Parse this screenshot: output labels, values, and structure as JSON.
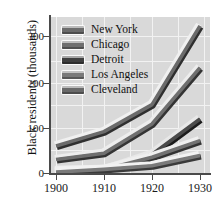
{
  "chart_data": {
    "type": "line",
    "title": "",
    "xlabel": "",
    "ylabel": "Black residents (thousands)",
    "x": [
      1900,
      1910,
      1920,
      1930
    ],
    "xtick_labels": [
      "1900",
      "1910",
      "1920",
      "1930"
    ],
    "ytick_labels": [
      "0",
      "100",
      "200",
      "300"
    ],
    "yticks": [
      0,
      100,
      200,
      300
    ],
    "xlim": [
      1900,
      1930
    ],
    "ylim": [
      0,
      346
    ],
    "grid": true,
    "legend_position": "upper-left-inside",
    "plot_background": "#d9d9d9",
    "gridline_color": "#f2f2f2",
    "series": [
      {
        "name": "New York",
        "values": [
          60,
          92,
          152,
          327
        ],
        "color": "#6b6b6b",
        "shadow_color": "#2f2f2f",
        "highlight_color": "#f0f0f0"
      },
      {
        "name": "Chicago",
        "values": [
          30,
          44,
          109,
          234
        ],
        "color": "#6f6f6f",
        "shadow_color": "#343434",
        "highlight_color": "#ededed"
      },
      {
        "name": "Detroit",
        "values": [
          4,
          6,
          41,
          120
        ],
        "color": "#4b4b4b",
        "shadow_color": "#1c1c1c",
        "highlight_color": "#e8e8e8"
      },
      {
        "name": "Los Angeles",
        "values": [
          2,
          8,
          16,
          39
        ],
        "color": "#7a7a7a",
        "shadow_color": "#3a3a3a",
        "highlight_color": "#f2f2f2"
      },
      {
        "name": "Cleveland",
        "values": [
          6,
          8,
          35,
          72
        ],
        "color": "#727272",
        "shadow_color": "#333333",
        "highlight_color": "#efefef"
      }
    ]
  },
  "legend": {
    "items": [
      {
        "label": "New York",
        "swatch": "#6b6b6b"
      },
      {
        "label": "Chicago",
        "swatch": "#6f6f6f"
      },
      {
        "label": "Detroit",
        "swatch": "#3f3f3f"
      },
      {
        "label": "Los Angeles",
        "swatch": "#7a7a7a"
      },
      {
        "label": "Cleveland",
        "swatch": "#6a6a6a"
      }
    ]
  },
  "axes": {
    "y_title": "Black residents (thousands)",
    "y_labels": [
      "300",
      "200",
      "100",
      "0"
    ],
    "x_labels": [
      "1900",
      "1910",
      "1920",
      "1930"
    ]
  }
}
